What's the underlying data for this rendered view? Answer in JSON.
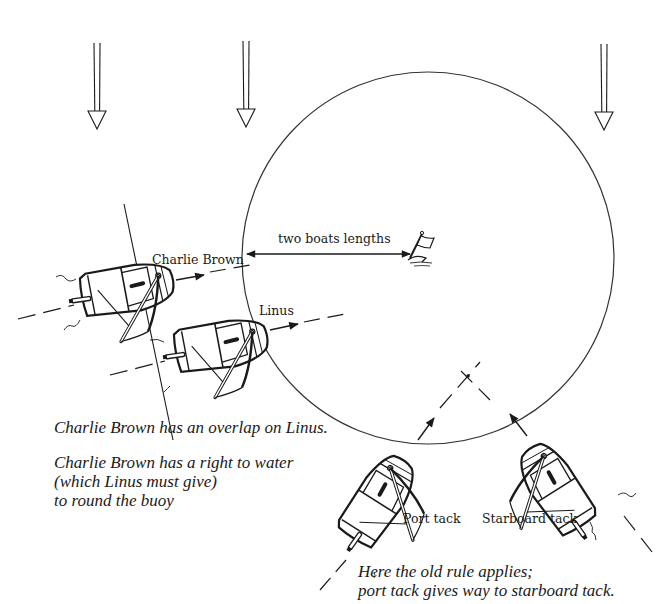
{
  "diagram": {
    "colors": {
      "ink": "#1a1a1a",
      "background": "#ffffff"
    },
    "wind_arrows": [
      {
        "id": "wind-left",
        "x": 97,
        "y_top": 43,
        "y_tip": 131
      },
      {
        "id": "wind-mid",
        "x": 246,
        "y_top": 43,
        "y_tip": 125
      },
      {
        "id": "wind-right",
        "x": 604,
        "y_top": 44,
        "y_tip": 126
      }
    ],
    "zone_circle": {
      "cx": 428,
      "cy": 258,
      "r": 186
    },
    "buoy": {
      "icon": "flag-buoy-icon",
      "x": 410,
      "y": 248
    },
    "measure": {
      "label": "two boats lengths",
      "x1": 245,
      "x2": 412,
      "y": 254
    },
    "boats": [
      {
        "id": "charlie-brown",
        "label": "Charlie Brown",
        "tack": "starboard-reach",
        "x": 130,
        "y": 290,
        "angle": -8
      },
      {
        "id": "linus",
        "label": "Linus",
        "tack": "starboard-reach",
        "x": 222,
        "y": 346,
        "angle": -8
      },
      {
        "id": "port-boat",
        "label": "Port tack",
        "x": 378,
        "y": 500,
        "angle": -55
      },
      {
        "id": "starboard-boat",
        "label": "Starboard tack",
        "x": 552,
        "y": 490,
        "angle": -125
      }
    ],
    "left_caption": {
      "line1": "Charlie Brown has an overlap on Linus.",
      "line2": "Charlie Brown has a right to water",
      "line3": "(which Linus must give)",
      "line4": "to round the buoy"
    },
    "right_caption": {
      "line1": "Here the old rule applies;",
      "line2": "port tack gives way to starboard tack."
    }
  }
}
